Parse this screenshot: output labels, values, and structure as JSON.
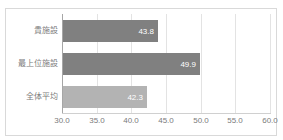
{
  "chart_data": {
    "type": "bar",
    "orientation": "horizontal",
    "title": "",
    "xlabel": "",
    "ylabel": "",
    "categories": [
      "貴施設",
      "最上位施設",
      "全体平均"
    ],
    "values": [
      43.8,
      49.9,
      42.3
    ],
    "value_labels": [
      "43.8",
      "49.9",
      "42.3"
    ],
    "bar_colors": [
      "#808080",
      "#808080",
      "#b3b3b3"
    ],
    "xlim": [
      30.0,
      60.0
    ],
    "xticks": [
      30.0,
      35.0,
      40.0,
      45.0,
      50.0,
      55.0,
      60.0
    ],
    "xtick_labels": [
      "30.0",
      "35.0",
      "40.0",
      "45.0",
      "50.0",
      "55.0",
      "60.0"
    ],
    "grid": true,
    "grid_axis": "x",
    "legend": false,
    "value_label_color": "#ffffff",
    "axis_label_color": "#7b7b7b",
    "frame_color": "#d9d9d9",
    "gridline_color": "#e3e3e3",
    "plot_background": "#ffffff"
  }
}
